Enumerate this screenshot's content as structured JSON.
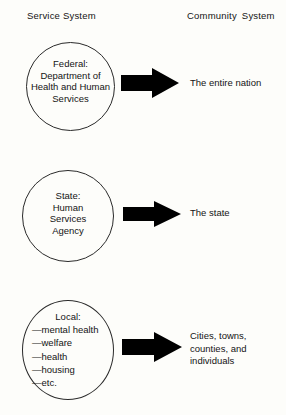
{
  "diagram": {
    "background_color": "#fdfdfa",
    "ink_color": "#141414",
    "arrow_color": "#000000",
    "headers": {
      "left": "Service System",
      "right_word_1": "Community",
      "right_word_2": "System"
    },
    "rows": [
      {
        "id": "federal",
        "circle_lines": [
          "Federal:",
          "Department of",
          "Health and Human",
          "Services"
        ],
        "arrow": "right-arrow-icon",
        "target_lines": [
          "The entire nation"
        ]
      },
      {
        "id": "state",
        "circle_lines": [
          "State:",
          "Human",
          "Services",
          "Agency"
        ],
        "arrow": "right-arrow-icon",
        "target_lines": [
          "The state"
        ]
      },
      {
        "id": "local",
        "circle_title": "Local:",
        "circle_items": [
          "—mental health",
          "—welfare",
          "—health",
          "—housing",
          "—etc."
        ],
        "arrow": "right-arrow-icon",
        "target_lines": [
          "Cities, towns,",
          "counties, and",
          "individuals"
        ]
      }
    ]
  }
}
